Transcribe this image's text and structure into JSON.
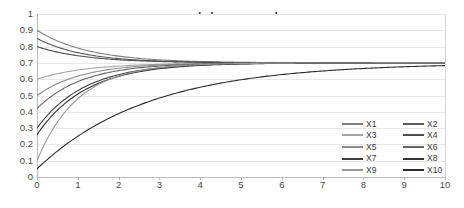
{
  "chart_data": {
    "type": "line",
    "title": "scaled max example",
    "xlabel": "",
    "ylabel": "",
    "xlim": [
      0,
      10
    ],
    "ylim": [
      0,
      1
    ],
    "grid": "horizontal",
    "legend_position": "bottom-right",
    "x_ticks": [
      "0",
      "1",
      "2",
      "3",
      "4",
      "5",
      "6",
      "7",
      "8",
      "9",
      "10"
    ],
    "y_ticks": [
      "0",
      "0.1",
      "0.2",
      "0.3",
      "0.4",
      "0.5",
      "0.6",
      "0.7",
      "0.8",
      "0.9",
      "1"
    ],
    "asymptote": 0.7,
    "x": [
      0,
      0.25,
      0.5,
      0.75,
      1,
      1.25,
      1.5,
      1.75,
      2,
      2.5,
      3,
      3.5,
      4,
      4.5,
      5,
      6,
      7,
      8,
      9,
      10
    ],
    "series": [
      {
        "name": "X1",
        "color": "#808080",
        "start": 0.9,
        "values": [
          0.9,
          0.868,
          0.839,
          0.814,
          0.791,
          0.771,
          0.754,
          0.748,
          0.742,
          0.73,
          0.722,
          0.716,
          0.712,
          0.709,
          0.707,
          0.704,
          0.702,
          0.701,
          0.7,
          0.7
        ]
      },
      {
        "name": "X2",
        "color": "#595959",
        "start": 0.85,
        "values": [
          0.85,
          0.824,
          0.801,
          0.781,
          0.763,
          0.753,
          0.745,
          0.738,
          0.733,
          0.724,
          0.718,
          0.713,
          0.71,
          0.708,
          0.706,
          0.703,
          0.702,
          0.701,
          0.7,
          0.7
        ]
      },
      {
        "name": "X3",
        "color": "#a6a6a6",
        "start": 0.6,
        "values": [
          0.6,
          0.618,
          0.633,
          0.646,
          0.656,
          0.665,
          0.672,
          0.678,
          0.682,
          0.689,
          0.693,
          0.696,
          0.697,
          0.698,
          0.699,
          0.7,
          0.7,
          0.7,
          0.7,
          0.7
        ]
      },
      {
        "name": "X4",
        "color": "#4d4d4d",
        "start": 0.8,
        "values": [
          0.8,
          0.782,
          0.766,
          0.754,
          0.744,
          0.736,
          0.73,
          0.725,
          0.721,
          0.715,
          0.711,
          0.708,
          0.706,
          0.704,
          0.703,
          0.702,
          0.701,
          0.7,
          0.7,
          0.7
        ]
      },
      {
        "name": "X5",
        "color": "#8c8c8c",
        "start": 0.5,
        "values": [
          0.5,
          0.54,
          0.572,
          0.598,
          0.619,
          0.637,
          0.651,
          0.662,
          0.67,
          0.682,
          0.689,
          0.693,
          0.696,
          0.697,
          0.698,
          0.699,
          0.7,
          0.7,
          0.7,
          0.7
        ]
      },
      {
        "name": "X6",
        "color": "#666666",
        "start": 0.42,
        "values": [
          0.42,
          0.476,
          0.52,
          0.556,
          0.585,
          0.609,
          0.628,
          0.643,
          0.656,
          0.673,
          0.683,
          0.689,
          0.693,
          0.696,
          0.697,
          0.699,
          0.7,
          0.7,
          0.7,
          0.7
        ]
      },
      {
        "name": "X7",
        "color": "#404040",
        "start": 0.3,
        "values": [
          0.3,
          0.378,
          0.44,
          0.49,
          0.53,
          0.563,
          0.589,
          0.611,
          0.628,
          0.654,
          0.671,
          0.681,
          0.687,
          0.692,
          0.694,
          0.697,
          0.699,
          0.7,
          0.7,
          0.7
        ]
      },
      {
        "name": "X8",
        "color": "#333333",
        "start": 0.26,
        "values": [
          0.26,
          0.345,
          0.412,
          0.466,
          0.509,
          0.544,
          0.572,
          0.595,
          0.614,
          0.643,
          0.663,
          0.675,
          0.683,
          0.689,
          0.692,
          0.696,
          0.698,
          0.699,
          0.7,
          0.7
        ]
      },
      {
        "name": "X9",
        "color": "#999999",
        "start": 0.1,
        "values": [
          0.1,
          0.23,
          0.333,
          0.415,
          0.48,
          0.532,
          0.574,
          0.607,
          0.634,
          0.673,
          0.672,
          0.681,
          0.688,
          0.692,
          0.695,
          0.698,
          0.699,
          0.7,
          0.7,
          0.7
        ]
      },
      {
        "name": "X10",
        "color": "#2b2b2b",
        "start": 0.05,
        "values": [
          0.05,
          0.105,
          0.157,
          0.205,
          0.25,
          0.292,
          0.331,
          0.367,
          0.4,
          0.459,
          0.507,
          0.547,
          0.58,
          0.607,
          0.629,
          0.66,
          0.678,
          0.688,
          0.694,
          0.7
        ]
      }
    ]
  },
  "legend": {
    "entries": [
      {
        "label": "X1"
      },
      {
        "label": "X2"
      },
      {
        "label": "X3"
      },
      {
        "label": "X4"
      },
      {
        "label": "X5"
      },
      {
        "label": "X6"
      },
      {
        "label": "X7"
      },
      {
        "label": "X8"
      },
      {
        "label": "X9"
      },
      {
        "label": "X10"
      }
    ]
  }
}
